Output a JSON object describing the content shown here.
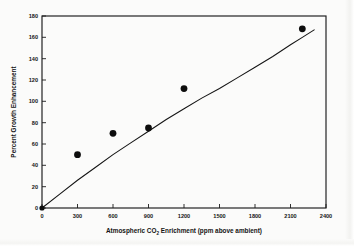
{
  "chart_data": {
    "type": "scatter",
    "title": "",
    "xlabel": "Atmospheric CO2 Enrichment (ppm above ambient)",
    "xlabel_parts": {
      "before": "Atmospheric CO",
      "subscript": "2",
      "after": " Enrichment (ppm above ambient)"
    },
    "ylabel": "Percent Growth Enhancement",
    "xlim": [
      0,
      2400
    ],
    "ylim": [
      0,
      180
    ],
    "xticks": [
      0,
      300,
      600,
      900,
      1200,
      1500,
      1800,
      2100,
      2400
    ],
    "xtick_labels": [
      "0",
      "300",
      "600",
      "900",
      "1200",
      "1500",
      "1800",
      "2100",
      "2400"
    ],
    "yticks": [
      0,
      20,
      40,
      60,
      80,
      100,
      120,
      140,
      160,
      180
    ],
    "ytick_labels": [
      "0",
      "20",
      "40",
      "60",
      "80",
      "100",
      "120",
      "140",
      "160",
      "180"
    ],
    "grid": false,
    "legend": null,
    "marker_style": "filled-circle",
    "marker_color": "#0d0d0d",
    "curve_color": "#141414",
    "frame_color": "#1b1b1b",
    "points": [
      {
        "x": 0,
        "y": 0
      },
      {
        "x": 300,
        "y": 50
      },
      {
        "x": 600,
        "y": 70
      },
      {
        "x": 900,
        "y": 75
      },
      {
        "x": 1200,
        "y": 112
      },
      {
        "x": 2200,
        "y": 168
      }
    ],
    "fit_curve": [
      {
        "x": 0,
        "y": 0
      },
      {
        "x": 150,
        "y": 13
      },
      {
        "x": 300,
        "y": 26
      },
      {
        "x": 450,
        "y": 38
      },
      {
        "x": 600,
        "y": 50
      },
      {
        "x": 750,
        "y": 61
      },
      {
        "x": 900,
        "y": 72
      },
      {
        "x": 1050,
        "y": 83
      },
      {
        "x": 1200,
        "y": 93
      },
      {
        "x": 1350,
        "y": 103
      },
      {
        "x": 1500,
        "y": 112
      },
      {
        "x": 1650,
        "y": 122
      },
      {
        "x": 1800,
        "y": 132
      },
      {
        "x": 1950,
        "y": 142
      },
      {
        "x": 2100,
        "y": 153
      },
      {
        "x": 2200,
        "y": 160
      },
      {
        "x": 2300,
        "y": 167
      }
    ]
  }
}
